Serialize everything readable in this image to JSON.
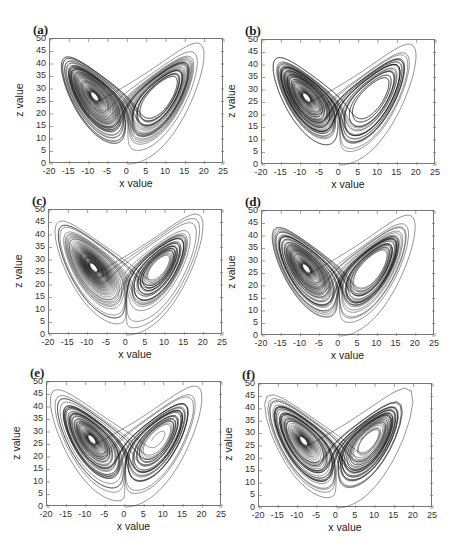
{
  "chart_data": [
    {
      "panel": "(a)",
      "type": "line",
      "title": "",
      "xlabel": "x value",
      "ylabel": "z value",
      "xlim": [
        -20,
        25
      ],
      "ylim": [
        0,
        50
      ],
      "xticks": [
        "-20",
        "-15",
        "-10",
        "-5",
        "0",
        "5",
        "10",
        "15",
        "20",
        "25"
      ],
      "yticks": [
        "0",
        "5",
        "10",
        "15",
        "20",
        "25",
        "30",
        "35",
        "40",
        "45",
        "50"
      ],
      "description": "Lorenz attractor x-z projection, two lobes centered near (-8.5,27) and (8.5,27)",
      "grid": false,
      "legend": null
    },
    {
      "panel": "(b)",
      "type": "line",
      "title": "",
      "xlabel": "",
      "ylabel": "z value",
      "xlim": [
        -20,
        25
      ],
      "ylim": [
        0,
        50
      ],
      "xticks": [
        "-20",
        "-15",
        "-10",
        "-5",
        "0",
        "5",
        "10",
        "15",
        "20",
        "25"
      ],
      "yticks": [
        "0",
        "5",
        "10",
        "15",
        "20",
        "25",
        "30",
        "35",
        "40",
        "45",
        "50"
      ],
      "description": "Lorenz attractor x-z projection",
      "grid": false,
      "legend": null
    },
    {
      "panel": "(c)",
      "type": "line",
      "title": "",
      "xlabel": "x value",
      "ylabel": "z value",
      "xlim": [
        -20,
        25
      ],
      "ylim": [
        0,
        50
      ],
      "xticks": [
        "-20",
        "-15",
        "-10",
        "-5",
        "0",
        "5",
        "10",
        "15",
        "20",
        "25"
      ],
      "yticks": [
        "0",
        "5",
        "10",
        "15",
        "20",
        "25",
        "30",
        "35",
        "40",
        "45",
        "50"
      ],
      "description": "Lorenz attractor x-z projection",
      "grid": false,
      "legend": null
    },
    {
      "panel": "(d)",
      "type": "line",
      "title": "",
      "xlabel": "x value",
      "ylabel": "z value",
      "xlim": [
        -20,
        25
      ],
      "ylim": [
        0,
        50
      ],
      "xticks": [
        "-20",
        "-15",
        "-10",
        "-5",
        "0",
        "5",
        "10",
        "15",
        "20",
        "25"
      ],
      "yticks": [
        "0",
        "5",
        "10",
        "15",
        "20",
        "25",
        "30",
        "35",
        "40",
        "45",
        "50"
      ],
      "description": "Lorenz attractor x-z projection",
      "grid": false,
      "legend": null
    },
    {
      "panel": "(e)",
      "type": "line",
      "title": "",
      "xlabel": "x value",
      "ylabel": "z value",
      "xlim": [
        -20,
        25
      ],
      "ylim": [
        0,
        50
      ],
      "xticks": [
        "-20",
        "-15",
        "-10",
        "-5",
        "0",
        "5",
        "10",
        "15",
        "20",
        "25"
      ],
      "yticks": [
        "0",
        "5",
        "10",
        "15",
        "20",
        "25",
        "30",
        "35",
        "40",
        "45",
        "50"
      ],
      "description": "Lorenz attractor x-z projection",
      "grid": false,
      "legend": null
    },
    {
      "panel": "(f)",
      "type": "line",
      "title": "",
      "xlabel": "x value",
      "ylabel": "z value",
      "xlim": [
        -20,
        25
      ],
      "ylim": [
        0,
        50
      ],
      "xticks": [
        "-20",
        "-15",
        "-10",
        "-5",
        "0",
        "5",
        "10",
        "15",
        "20",
        "25"
      ],
      "yticks": [
        "0",
        "5",
        "10",
        "15",
        "20",
        "25",
        "30",
        "35",
        "40",
        "45",
        "50"
      ],
      "description": "Lorenz attractor x-z projection, coarser step (polygonal trajectory)",
      "grid": false,
      "legend": null
    }
  ],
  "panels": [
    {
      "label": "(a)",
      "xlabel": "x value",
      "ylabel": "z value",
      "box": [
        49,
        38,
        174,
        125
      ],
      "step": 0.005,
      "seed": 0
    },
    {
      "label": "(b)",
      "xlabel": "x value",
      "ylabel": "z value",
      "box": [
        261,
        39,
        174,
        125
      ],
      "step": 0.005,
      "seed": 1
    },
    {
      "label": "(c)",
      "xlabel": "x value",
      "ylabel": "z value",
      "box": [
        48,
        209,
        174,
        125
      ],
      "step": 0.005,
      "seed": 2
    },
    {
      "label": "(d)",
      "xlabel": "x value",
      "ylabel": "z value",
      "box": [
        261,
        210,
        173,
        125
      ],
      "step": 0.005,
      "seed": 3
    },
    {
      "label": "(e)",
      "xlabel": "x value",
      "ylabel": "z value",
      "box": [
        46,
        381,
        175,
        125
      ],
      "step": 0.005,
      "seed": 4
    },
    {
      "label": "(f)",
      "xlabel": "x value",
      "ylabel": "z value",
      "box": [
        258,
        383,
        174,
        124
      ],
      "step": 0.02,
      "seed": 5
    }
  ],
  "style": {
    "line_color": "#111111",
    "axis_color": "#777777",
    "background": "#ffffff"
  }
}
